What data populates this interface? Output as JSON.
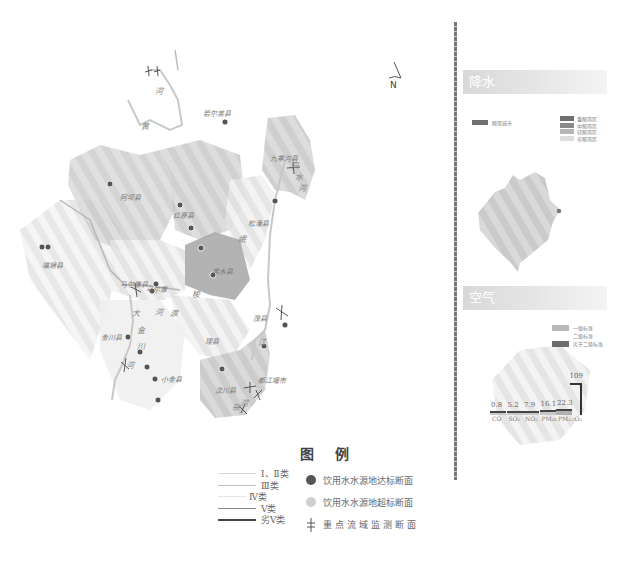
{
  "map": {
    "north_label": "N",
    "counties": [
      {
        "name": "若尔盖县",
        "x": 203,
        "y": 108
      },
      {
        "name": "阿坝县",
        "x": 120,
        "y": 192
      },
      {
        "name": "红原县",
        "x": 173,
        "y": 210
      },
      {
        "name": "九寨沟县",
        "x": 270,
        "y": 153
      },
      {
        "name": "松潘县",
        "x": 248,
        "y": 218
      },
      {
        "name": "壤塘县",
        "x": 42,
        "y": 260
      },
      {
        "name": "黑水县",
        "x": 212,
        "y": 266
      },
      {
        "name": "马尔康县",
        "x": 120,
        "y": 279
      },
      {
        "name": "马尔康",
        "x": 146,
        "y": 284
      },
      {
        "name": "金川县",
        "x": 101,
        "y": 332
      },
      {
        "name": "小金县",
        "x": 161,
        "y": 374
      },
      {
        "name": "理县",
        "x": 205,
        "y": 336
      },
      {
        "name": "茂县",
        "x": 253,
        "y": 313
      },
      {
        "name": "汶川县",
        "x": 215,
        "y": 385
      },
      {
        "name": "都江堰市",
        "x": 258,
        "y": 375
      }
    ],
    "rivers": [
      {
        "name": "河",
        "x": 155,
        "y": 85
      },
      {
        "name": "黄",
        "x": 141,
        "y": 120
      },
      {
        "name": "白",
        "x": 291,
        "y": 159
      },
      {
        "name": "水",
        "x": 295,
        "y": 171
      },
      {
        "name": "河",
        "x": 298,
        "y": 182
      },
      {
        "name": "岷",
        "x": 238,
        "y": 233
      },
      {
        "name": "大",
        "x": 132,
        "y": 307
      },
      {
        "name": "河",
        "x": 155,
        "y": 306
      },
      {
        "name": "渡",
        "x": 170,
        "y": 307
      },
      {
        "name": "梭",
        "x": 192,
        "y": 288
      },
      {
        "name": "金",
        "x": 137,
        "y": 324
      },
      {
        "name": "川",
        "x": 137,
        "y": 340
      },
      {
        "name": "河",
        "x": 126,
        "y": 359
      },
      {
        "name": "江",
        "x": 258,
        "y": 336
      },
      {
        "name": "河",
        "x": 240,
        "y": 397
      },
      {
        "name": "杂",
        "x": 232,
        "y": 401
      }
    ]
  },
  "precipitation": {
    "header": "降水",
    "acid_rain_label": "酸雨城市",
    "legend": [
      {
        "label": "重酸雨区",
        "color": "#707070"
      },
      {
        "label": "中酸雨区",
        "color": "#8a8a8a"
      },
      {
        "label": "轻酸雨区",
        "color": "#b5b5b5"
      },
      {
        "label": "非酸雨区",
        "color": "#dddddd"
      }
    ]
  },
  "air": {
    "header": "空气",
    "legend": [
      {
        "label": "一级标准",
        "color": "#b8b8b8"
      },
      {
        "label": "二级标准",
        "color": "#e6e6e6"
      },
      {
        "label": "劣于二级标准",
        "color": "#6d6d6d"
      }
    ]
  },
  "chart_data": {
    "type": "bar",
    "title": "",
    "categories": [
      "CO",
      "SO₂",
      "NO₂",
      "PM₁₀",
      "PM₂.₅",
      "O₃"
    ],
    "values": [
      0.8,
      5.2,
      7.9,
      16.1,
      22.3,
      109
    ],
    "data_labels": [
      "0.8",
      "5.2",
      "7.9",
      "16.1",
      "22.3",
      "109"
    ],
    "xlabel": "",
    "ylabel": "",
    "grid": false
  },
  "legend": {
    "title": "图 例",
    "line_items": [
      {
        "label": "Ⅰ、Ⅱ类",
        "color": "#d8d8d8",
        "width": 1
      },
      {
        "label": "Ⅲ类",
        "color": "#bdbdbd",
        "width": 1
      },
      {
        "label": "Ⅳ类",
        "color": "#e4e4e4",
        "width": 1
      },
      {
        "label": "Ⅴ类",
        "color": "#8a8a8a",
        "width": 1
      },
      {
        "label": "劣Ⅴ类",
        "color": "#444444",
        "width": 2
      }
    ],
    "symbol_items": [
      {
        "label": "饮用水水源地达标断面",
        "icon": "water-source-ok-icon"
      },
      {
        "label": "饮用水水源地超标断面",
        "icon": "water-source-exceed-icon"
      },
      {
        "label": "重点流域监测断面",
        "icon": "monitoring-section-icon"
      }
    ]
  }
}
